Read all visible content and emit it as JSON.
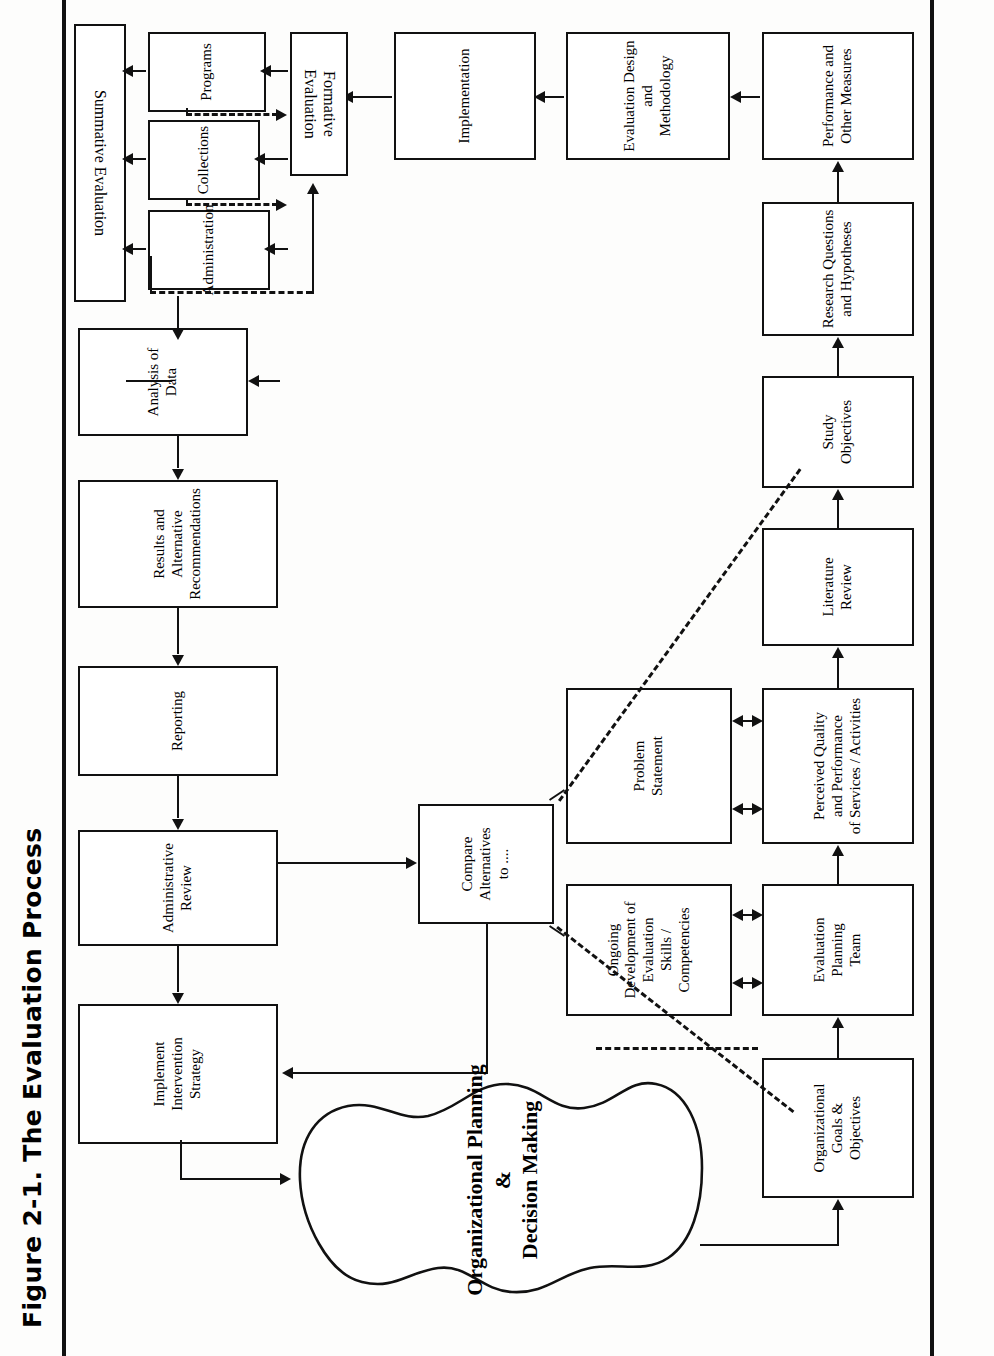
{
  "figure": {
    "title": "Figure 2-1.  The Evaluation Process",
    "orientation": "rotated-90-ccw",
    "accent": "#111111",
    "background": "#fdfdfc"
  },
  "nodes": {
    "organizational_goals": {
      "label": "Organizational\nGoals &\nObjectives"
    },
    "evaluation_planning_team": {
      "label": "Evaluation\nPlanning\nTeam"
    },
    "perceived_quality": {
      "label": "Perceived Quality\nand Performance\nof Services / Activities"
    },
    "literature_review": {
      "label": "Literature\nReview"
    },
    "study_objectives": {
      "label": "Study\nObjectives"
    },
    "research_questions": {
      "label": "Research Questions\nand Hypotheses"
    },
    "performance_measures": {
      "label": "Performance and\nOther Measures"
    },
    "ongoing_development": {
      "label": "Ongoing\nDevelopment of Evaluation\nSkills / Competencies"
    },
    "problem_statement": {
      "label": "Problem\nStatement"
    },
    "evaluation_design": {
      "label": "Evaluation Design and\nMethodology"
    },
    "implementation": {
      "label": "Implementation"
    },
    "formative_evaluation": {
      "label": "Formative Evaluation"
    },
    "programs": {
      "label": "Programs"
    },
    "collections": {
      "label": "Collections"
    },
    "administration": {
      "label": "Administration"
    },
    "summative_evaluation": {
      "label": "Summative Evaluation"
    },
    "analysis_of_data": {
      "label": "Analysis of Data"
    },
    "results_alternatives": {
      "label": "Results and\nAlternative\nRecommendations"
    },
    "reporting": {
      "label": "Reporting"
    },
    "administrative_review": {
      "label": "Administrative\nReview"
    },
    "implement_intervention": {
      "label": "Implement\nIntervention\nStrategy"
    },
    "compare_alternatives": {
      "label": "Compare\nAlternatives\nto ...."
    },
    "org_planning_blob": {
      "label": "Organizational Planning\n&\nDecision Making"
    }
  }
}
